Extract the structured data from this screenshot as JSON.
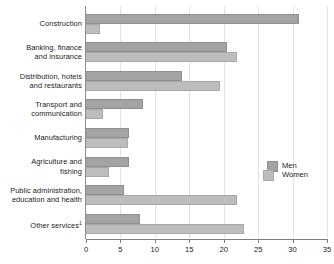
{
  "chart_data": {
    "type": "bar",
    "orientation": "horizontal",
    "title": "",
    "subtitle": "",
    "xlabel": "",
    "ylabel": "",
    "xlim": [
      0,
      35
    ],
    "xticks": [
      0,
      5,
      10,
      15,
      20,
      25,
      30,
      35
    ],
    "xtick_labels": [
      "0",
      "5",
      "10",
      "15",
      "20",
      "25",
      "30",
      "35"
    ],
    "grid": "vertical",
    "legend_position": "middle-right",
    "categories": [
      "Construction",
      "Banking, finance and insurance",
      "Distribution, hotels and restaurants",
      "Transport and communication",
      "Manufacturing",
      "Agriculture and fishing",
      "Public administration, education and health",
      "Other services"
    ],
    "category_lines": [
      [
        "Construction"
      ],
      [
        "Banking, finance",
        "and insurance"
      ],
      [
        "Distribution, hotels",
        "and restaurants"
      ],
      [
        "Transport and",
        "communication"
      ],
      [
        "Manufacturing"
      ],
      [
        "Agriculture and",
        "fishing"
      ],
      [
        "Public administration,",
        "education and health"
      ],
      [
        "Other services"
      ]
    ],
    "category_footnote_marks": [
      "",
      "",
      "",
      "",
      "",
      "",
      "",
      "1"
    ],
    "series": [
      {
        "name": "Men",
        "color": "#a3a3a3",
        "values": [
          31.0,
          20.5,
          14.0,
          8.3,
          6.3,
          6.3,
          5.5,
          7.8
        ]
      },
      {
        "name": "Women",
        "color": "#bdbdbd",
        "values": [
          2.0,
          22.0,
          19.5,
          2.4,
          6.1,
          3.3,
          22.0,
          23.0
        ]
      }
    ]
  },
  "legend": {
    "items": [
      {
        "label": "Men"
      },
      {
        "label": "Women"
      }
    ]
  },
  "colors": {
    "men": "#a3a3a3",
    "women": "#bdbdbd",
    "gridline": "#e2e2e2",
    "axis": "#7d7d7d",
    "text": "#1a1a1a",
    "background": "#ffffff"
  }
}
